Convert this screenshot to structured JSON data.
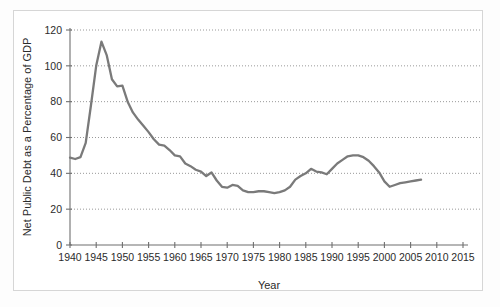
{
  "figure": {
    "background_color": "#ffffff",
    "border_color": "#d6d6d6"
  },
  "axes": {
    "x_title": "Year",
    "y_title": "Net Public Debt as a Percentage of GDP",
    "x_ticks": [
      "1940",
      "1945",
      "1950",
      "1955",
      "1960",
      "1965",
      "1970",
      "1975",
      "1980",
      "1985",
      "1990",
      "1995",
      "2000",
      "2005",
      "2010",
      "2015"
    ],
    "y_ticks": [
      "0",
      "20",
      "40",
      "60",
      "80",
      "100",
      "120"
    ]
  },
  "chart_data": {
    "type": "line",
    "title": "",
    "xlabel": "Year",
    "ylabel": "Net Public Debt as a Percentage of GDP",
    "xlim": [
      1940,
      2015
    ],
    "ylim": [
      0,
      120
    ],
    "grid": true,
    "grid_axis": "y",
    "legend": "none",
    "line_color": "#7a7a7a",
    "series": [
      {
        "name": "Net Public Debt as a Percentage of GDP",
        "x": [
          1940,
          1941,
          1942,
          1943,
          1944,
          1945,
          1946,
          1947,
          1948,
          1949,
          1950,
          1951,
          1952,
          1953,
          1954,
          1955,
          1956,
          1957,
          1958,
          1959,
          1960,
          1961,
          1962,
          1963,
          1964,
          1965,
          1966,
          1967,
          1968,
          1969,
          1970,
          1971,
          1972,
          1973,
          1974,
          1975,
          1976,
          1977,
          1978,
          1979,
          1980,
          1981,
          1982,
          1983,
          1984,
          1985,
          1986,
          1987,
          1988,
          1989,
          1990,
          1991,
          1992,
          1993,
          1994,
          1995,
          1996,
          1997,
          1998,
          1999,
          2000,
          2001,
          2002,
          2003,
          2004,
          2005,
          2006,
          2007
        ],
        "y": [
          48.8,
          48.0,
          49.0,
          57.0,
          78.0,
          100.0,
          113.5,
          106.0,
          92.5,
          88.5,
          89.0,
          80.0,
          74.0,
          70.0,
          66.5,
          63.0,
          59.0,
          56.0,
          55.5,
          53.0,
          50.0,
          49.5,
          45.5,
          44.0,
          42.0,
          41.0,
          38.5,
          40.5,
          36.0,
          32.5,
          32.0,
          33.5,
          33.0,
          30.5,
          29.5,
          29.5,
          30.0,
          30.0,
          29.5,
          29.0,
          29.5,
          30.5,
          32.5,
          36.5,
          38.5,
          40.0,
          42.5,
          41.0,
          40.5,
          39.5,
          42.5,
          45.5,
          47.5,
          49.5,
          50.0,
          50.0,
          49.0,
          47.0,
          44.0,
          40.5,
          35.5,
          32.5,
          33.5,
          34.5,
          35.0,
          35.5,
          36.0,
          36.5
        ]
      }
    ]
  }
}
